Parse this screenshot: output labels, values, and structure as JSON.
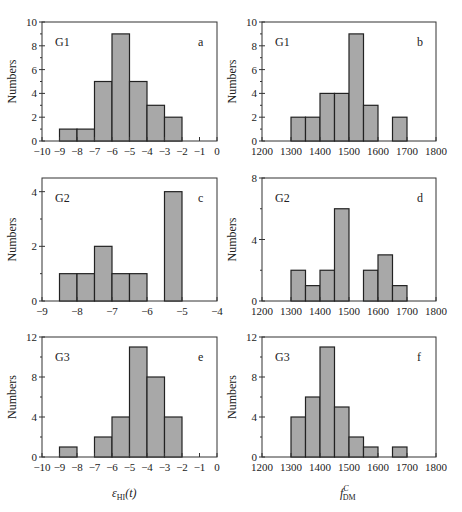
{
  "figure": {
    "xlabel_left": "ε_HI(t)",
    "xlabel_left_main": "ε",
    "xlabel_left_sub": "HI",
    "xlabel_left_suffix": "(t)",
    "xlabel_right_main": "f",
    "xlabel_right_sup": "C",
    "xlabel_right_sub": "DM",
    "bar_fill": "#a8a8a8",
    "bar_stroke": "#222222"
  },
  "chart_data": [
    {
      "panel": "a",
      "group": "G1",
      "type": "bar",
      "title": "",
      "xlabel": "",
      "ylabel": "Numbers",
      "xlim": [
        -10,
        0
      ],
      "ylim": [
        0,
        10
      ],
      "xticks": [
        -10,
        -9,
        -8,
        -7,
        -6,
        -5,
        -4,
        -3,
        -2,
        -1,
        0
      ],
      "yticks": [
        0,
        2,
        4,
        6,
        8,
        10
      ],
      "bin_edges": [
        -9,
        -8,
        -7,
        -6,
        -5,
        -4,
        -3,
        -2
      ],
      "values": [
        1,
        1,
        5,
        9,
        5,
        3,
        2
      ]
    },
    {
      "panel": "b",
      "group": "G1",
      "type": "bar",
      "title": "",
      "xlabel": "",
      "ylabel": "Numbers",
      "xlim": [
        1200,
        1800
      ],
      "ylim": [
        0,
        10
      ],
      "xticks": [
        1200,
        1300,
        1400,
        1500,
        1600,
        1700,
        1800
      ],
      "yticks": [
        0,
        2,
        4,
        6,
        8,
        10
      ],
      "bin_edges": [
        1300,
        1350,
        1400,
        1450,
        1500,
        1550,
        1600,
        1650,
        1700
      ],
      "values": [
        2,
        2,
        4,
        4,
        9,
        3,
        0,
        2
      ]
    },
    {
      "panel": "c",
      "group": "G2",
      "type": "bar",
      "title": "",
      "xlabel": "",
      "ylabel": "Numbers",
      "xlim": [
        -9,
        -4
      ],
      "ylim": [
        0,
        4.5
      ],
      "xticks": [
        -9,
        -8,
        -7,
        -6,
        -5,
        -4
      ],
      "yticks": [
        0,
        2,
        4
      ],
      "bin_edges": [
        -8.5,
        -8,
        -7.5,
        -7,
        -6.5,
        -6,
        -5.5,
        -5
      ],
      "values": [
        1,
        1,
        2,
        1,
        1,
        0,
        4
      ]
    },
    {
      "panel": "d",
      "group": "G2",
      "type": "bar",
      "title": "",
      "xlabel": "",
      "ylabel": "Numbers",
      "xlim": [
        1200,
        1800
      ],
      "ylim": [
        0,
        8
      ],
      "xticks": [
        1200,
        1300,
        1400,
        1500,
        1600,
        1700,
        1800
      ],
      "yticks": [
        0,
        4,
        8
      ],
      "bin_edges": [
        1300,
        1350,
        1400,
        1450,
        1500,
        1550,
        1600,
        1650,
        1700
      ],
      "values": [
        2,
        1,
        2,
        6,
        0,
        2,
        3,
        1
      ]
    },
    {
      "panel": "e",
      "group": "G3",
      "type": "bar",
      "title": "",
      "xlabel": "ε_HI(t)",
      "ylabel": "Numbers",
      "xlim": [
        -10,
        0
      ],
      "ylim": [
        0,
        12
      ],
      "xticks": [
        -10,
        -9,
        -8,
        -7,
        -6,
        -5,
        -4,
        -3,
        -2,
        -1,
        0
      ],
      "yticks": [
        0,
        4,
        8,
        12
      ],
      "bin_edges": [
        -9,
        -8,
        -7,
        -6,
        -5,
        -4,
        -3,
        -2
      ],
      "values": [
        1,
        0,
        2,
        4,
        11,
        8,
        4
      ]
    },
    {
      "panel": "f",
      "group": "G3",
      "type": "bar",
      "title": "",
      "xlabel": "f^C_DM",
      "ylabel": "Numbers",
      "xlim": [
        1200,
        1800
      ],
      "ylim": [
        0,
        12
      ],
      "xticks": [
        1200,
        1300,
        1400,
        1500,
        1600,
        1700,
        1800
      ],
      "yticks": [
        0,
        4,
        8,
        12
      ],
      "bin_edges": [
        1300,
        1350,
        1400,
        1450,
        1500,
        1550,
        1600,
        1650,
        1700
      ],
      "values": [
        4,
        6,
        11,
        5,
        2,
        1,
        0,
        1
      ]
    }
  ],
  "layout": {
    "panels": [
      {
        "x0": 42,
        "x1": 217,
        "y0": 22,
        "y1": 141,
        "minor_y": 1
      },
      {
        "x0": 262,
        "x1": 436,
        "y0": 22,
        "y1": 141,
        "minor_y": 1
      },
      {
        "x0": 42,
        "x1": 217,
        "y0": 178,
        "y1": 301,
        "minor_y": 1
      },
      {
        "x0": 262,
        "x1": 436,
        "y0": 178,
        "y1": 301,
        "minor_y": 2
      },
      {
        "x0": 42,
        "x1": 217,
        "y0": 337,
        "y1": 457,
        "minor_y": 2
      },
      {
        "x0": 262,
        "x1": 436,
        "y0": 337,
        "y1": 457,
        "minor_y": 2
      }
    ]
  }
}
